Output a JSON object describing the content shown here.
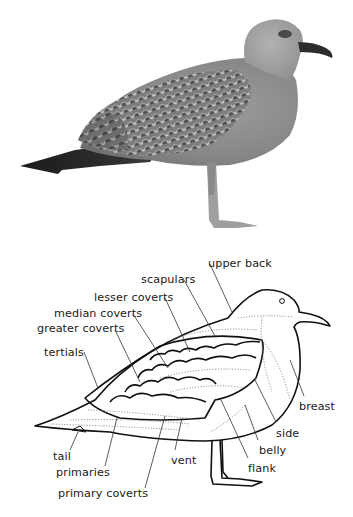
{
  "figure": {
    "photo": {
      "subject": "juvenile gull standing, side view",
      "tone": "grayscale"
    },
    "diagram": {
      "style": "black line drawing with dotted feather tracts",
      "labels": [
        {
          "id": "upper_back",
          "text": "upper back",
          "x": 208,
          "y": 257
        },
        {
          "id": "scapulars",
          "text": "scapulars",
          "x": 141,
          "y": 273
        },
        {
          "id": "lesser_coverts",
          "text": "lesser coverts",
          "x": 94,
          "y": 291
        },
        {
          "id": "median_coverts",
          "text": "median coverts",
          "x": 54,
          "y": 307
        },
        {
          "id": "greater_coverts",
          "text": "greater coverts",
          "x": 37,
          "y": 322
        },
        {
          "id": "tertials",
          "text": "tertials",
          "x": 44,
          "y": 346
        },
        {
          "id": "breast",
          "text": "breast",
          "x": 299,
          "y": 400
        },
        {
          "id": "side",
          "text": "side",
          "x": 276,
          "y": 427
        },
        {
          "id": "belly",
          "text": "belly",
          "x": 259,
          "y": 444
        },
        {
          "id": "flank",
          "text": "flank",
          "x": 248,
          "y": 462
        },
        {
          "id": "vent",
          "text": "vent",
          "x": 171,
          "y": 454
        },
        {
          "id": "tail",
          "text": "tail",
          "x": 53,
          "y": 450
        },
        {
          "id": "primaries",
          "text": "primaries",
          "x": 56,
          "y": 466
        },
        {
          "id": "primary_coverts",
          "text": "primary coverts",
          "x": 58,
          "y": 487
        }
      ]
    },
    "colors": {
      "background": "#ffffff",
      "ink": "#111111",
      "label": "#1a1a1a",
      "leader_line": "#333333",
      "dotted_tract": "#777777"
    }
  }
}
